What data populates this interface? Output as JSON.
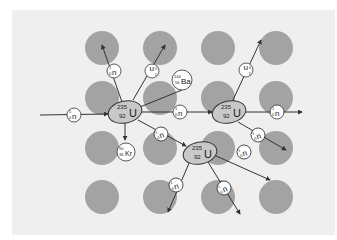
{
  "diagram": {
    "colors": {
      "background": "#ffffff",
      "panel": "#efefef",
      "target_nucleus": "#9e9e9e",
      "uranium_fill": "#c8c8c8",
      "particle_fill": "#ffffff",
      "line": "#333333"
    },
    "uranium": {
      "symbol": "U",
      "mass_number": "235",
      "atomic_number": "92"
    },
    "neutron": {
      "symbol": "n",
      "mass_number": "1",
      "atomic_number": "0"
    },
    "barium": {
      "symbol": "Ba",
      "mass_number": "144",
      "atomic_number": "56"
    },
    "krypton": {
      "symbol": "Kr",
      "mass_number": "90",
      "atomic_number": "36"
    },
    "nodes": [
      {
        "id": "u1",
        "type": "uranium",
        "x": 125,
        "y": 112
      },
      {
        "id": "u2",
        "type": "uranium",
        "x": 229,
        "y": 112
      },
      {
        "id": "u3",
        "type": "uranium",
        "x": 200,
        "y": 153
      }
    ]
  }
}
